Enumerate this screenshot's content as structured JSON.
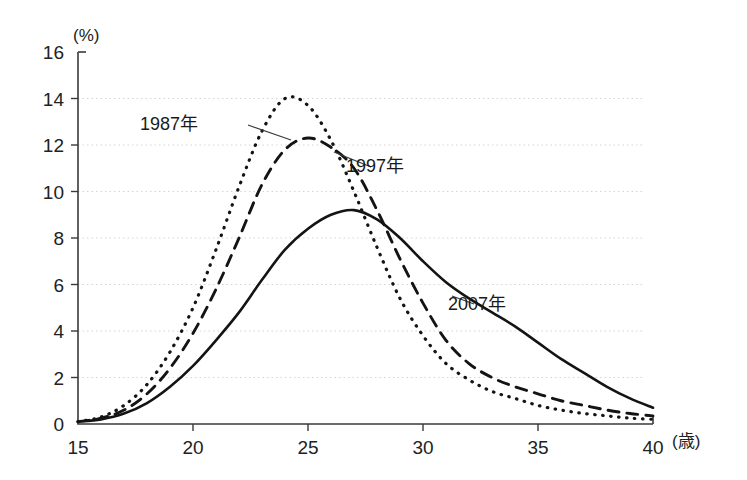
{
  "chart_data": {
    "type": "line",
    "title": "",
    "xlabel": "(歳)",
    "ylabel": "(%)",
    "xlim": [
      15,
      40
    ],
    "ylim": [
      0,
      16
    ],
    "xticks": [
      15,
      20,
      25,
      30,
      35,
      40
    ],
    "yticks": [
      0,
      2,
      4,
      6,
      8,
      10,
      12,
      14,
      16
    ],
    "grid": true,
    "legend_position": "inline-annotations",
    "x": [
      15,
      16,
      17,
      18,
      19,
      20,
      21,
      22,
      23,
      24,
      25,
      26,
      27,
      28,
      29,
      30,
      31,
      32,
      33,
      34,
      35,
      36,
      37,
      38,
      39,
      40
    ],
    "series": [
      {
        "name": "1987年",
        "style": "dotted",
        "values": [
          0.1,
          0.3,
          0.8,
          1.7,
          3.1,
          5.0,
          7.5,
          10.2,
          12.6,
          14.0,
          13.7,
          12.2,
          10.0,
          7.6,
          5.4,
          3.8,
          2.6,
          1.9,
          1.4,
          1.1,
          0.8,
          0.6,
          0.45,
          0.35,
          0.25,
          0.2
        ]
      },
      {
        "name": "1997年",
        "style": "dashed",
        "values": [
          0.1,
          0.25,
          0.6,
          1.3,
          2.4,
          3.9,
          5.8,
          8.0,
          10.3,
          11.8,
          12.3,
          11.9,
          11.0,
          9.2,
          7.1,
          5.2,
          3.6,
          2.6,
          2.0,
          1.6,
          1.3,
          1.0,
          0.8,
          0.6,
          0.45,
          0.35
        ]
      },
      {
        "name": "2007年",
        "style": "solid",
        "values": [
          0.1,
          0.2,
          0.45,
          0.9,
          1.6,
          2.5,
          3.6,
          4.8,
          6.2,
          7.5,
          8.4,
          9.0,
          9.2,
          8.8,
          8.0,
          7.0,
          6.1,
          5.4,
          4.8,
          4.2,
          3.5,
          2.8,
          2.2,
          1.6,
          1.1,
          0.7
        ]
      }
    ],
    "annotations": [
      {
        "text": "1987年",
        "label_x": 169,
        "label_y": 130,
        "leader_from_x": 248,
        "leader_from_y": 125,
        "leader_to_x": 291,
        "leader_to_y": 140
      },
      {
        "text": "1997年",
        "label_x": 375,
        "label_y": 172,
        "leader_from_x": 371,
        "leader_from_y": 167,
        "leader_to_x": 334,
        "leader_to_y": 152
      },
      {
        "text": "2007年",
        "label_x": 477,
        "label_y": 310,
        "leader_from_x": 474,
        "leader_from_y": 304,
        "leader_to_x": 452,
        "leader_to_y": 296
      }
    ],
    "colors": {
      "line": "#141414",
      "axis": "#3a3a3a",
      "grid": "#d8d3cc",
      "background": "#ffffff"
    }
  }
}
